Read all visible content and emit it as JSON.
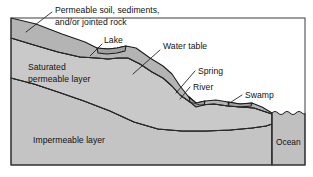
{
  "figure": {
    "width": 313,
    "height": 177,
    "background_color": "#ffffff"
  },
  "colors": {
    "unsaturated_zone": "#b4b4b4",
    "saturated_zone": "#c9c9c9",
    "impermeable_layer": "#c4c4c4",
    "surface_water": "#a8a8a8",
    "ocean": "#c0c0c0",
    "outline": "#1a1a1a",
    "text": "#111111",
    "page": "#ffffff"
  },
  "labels": {
    "permeable_soil": {
      "line1": "Permeable soil, sediments,",
      "line2": "and/or jointed rock",
      "x": 55,
      "y": 11
    },
    "lake": {
      "text": "Lake",
      "x": 104,
      "y": 42
    },
    "water_table": {
      "text": "Water table",
      "x": 163,
      "y": 48
    },
    "saturated_layer": {
      "line1": "Saturated",
      "line2": "permeable layer",
      "x": 28,
      "y": 69
    },
    "spring": {
      "text": "Spring",
      "x": 198,
      "y": 73
    },
    "river": {
      "text": "River",
      "x": 193,
      "y": 89
    },
    "swamp": {
      "text": "Swamp",
      "x": 245,
      "y": 97
    },
    "impermeable_layer": {
      "text": "Impermeable layer",
      "x": 33,
      "y": 141
    },
    "ocean": {
      "text": "Ocean",
      "x": 266,
      "y": 143
    }
  },
  "legend_order": [
    "Permeable soil, sediments, and/or jointed rock",
    "Lake",
    "Water table",
    "Saturated permeable layer",
    "Spring",
    "River",
    "Swamp",
    "Impermeable layer",
    "Ocean"
  ],
  "geometry": {
    "ground_surface": "M 11,18 L 36,24 L 62,34 L 85,42 L 97,48 L 108,49 L 117,48 L 126,46 L 136,48 L 150,58 L 163,66 L 172,74 L 180,86 L 188,96 L 196,103 L 205,101 L 216,100 L 228,102 L 240,104 L 252,103 L 262,107 L 272,113",
    "water_table_line": "M 11,38 L 34,45 L 58,52 L 80,57 L 97,58 L 108,59 L 118,58 L 128,58 L 140,64 L 152,72 L 163,78 L 172,86 L 180,95 L 190,102 L 200,105 L 214,104 L 228,106 L 242,107 L 254,108 L 266,112 L 272,114",
    "impermeable_top": "M 11,78 L 34,84 L 58,92 L 84,101 L 110,111 L 134,122 L 158,129 L 182,131 L 206,131 L 230,130 L 252,128 L 266,126 L 272,124",
    "lake_surface": "M 97,48 L 108,49 L 117,48 L 126,46",
    "river_surface": "M 188,96 L 196,103 L 205,101",
    "swamp_surface": "M 228,102 L 240,104 L 252,103",
    "ocean_left": 272,
    "ocean_top": 113,
    "frame": {
      "x": 11,
      "y": 18,
      "w": 294,
      "h": 147
    }
  }
}
